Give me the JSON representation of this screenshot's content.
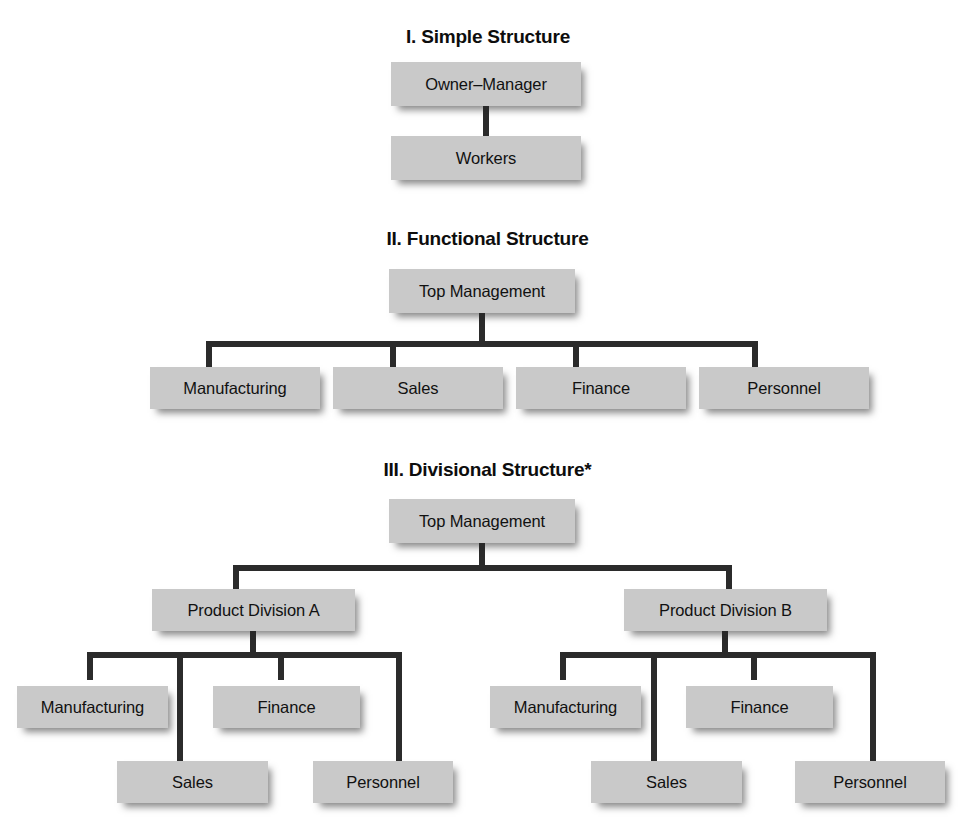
{
  "diagram": {
    "background_color": "#ffffff",
    "box_fill_color": "#c9c9c9",
    "connector_color": "#2b2b2b",
    "text_color": "#111111"
  },
  "sections": [
    {
      "id": "simple",
      "heading": "I. Simple Structure",
      "nodes": [
        {
          "id": "s-owner",
          "label": "Owner–Manager",
          "level": 0
        },
        {
          "id": "s-workers",
          "label": "Workers",
          "level": 1
        }
      ],
      "edges": [
        {
          "from": "s-owner",
          "to": "s-workers"
        }
      ]
    },
    {
      "id": "functional",
      "heading": "II. Functional Structure",
      "nodes": [
        {
          "id": "f-top",
          "label": "Top Management",
          "level": 0
        },
        {
          "id": "f-manufacturing",
          "label": "Manufacturing",
          "level": 1
        },
        {
          "id": "f-sales",
          "label": "Sales",
          "level": 1
        },
        {
          "id": "f-finance",
          "label": "Finance",
          "level": 1
        },
        {
          "id": "f-personnel",
          "label": "Personnel",
          "level": 1
        }
      ],
      "edges": [
        {
          "from": "f-top",
          "to": "f-manufacturing"
        },
        {
          "from": "f-top",
          "to": "f-sales"
        },
        {
          "from": "f-top",
          "to": "f-finance"
        },
        {
          "from": "f-top",
          "to": "f-personnel"
        }
      ]
    },
    {
      "id": "divisional",
      "heading": "III. Divisional Structure*",
      "nodes": [
        {
          "id": "d-top",
          "label": "Top Management",
          "level": 0
        },
        {
          "id": "d-div-a",
          "label": "Product Division A",
          "level": 1
        },
        {
          "id": "d-div-b",
          "label": "Product Division B",
          "level": 1
        },
        {
          "id": "da-manufacturing",
          "label": "Manufacturing",
          "level": 2
        },
        {
          "id": "da-sales",
          "label": "Sales",
          "level": 2
        },
        {
          "id": "da-finance",
          "label": "Finance",
          "level": 2
        },
        {
          "id": "da-personnel",
          "label": "Personnel",
          "level": 2
        },
        {
          "id": "db-manufacturing",
          "label": "Manufacturing",
          "level": 2
        },
        {
          "id": "db-sales",
          "label": "Sales",
          "level": 2
        },
        {
          "id": "db-finance",
          "label": "Finance",
          "level": 2
        },
        {
          "id": "db-personnel",
          "label": "Personnel",
          "level": 2
        }
      ],
      "edges": [
        {
          "from": "d-top",
          "to": "d-div-a"
        },
        {
          "from": "d-top",
          "to": "d-div-b"
        },
        {
          "from": "d-div-a",
          "to": "da-manufacturing"
        },
        {
          "from": "d-div-a",
          "to": "da-sales"
        },
        {
          "from": "d-div-a",
          "to": "da-finance"
        },
        {
          "from": "d-div-a",
          "to": "da-personnel"
        },
        {
          "from": "d-div-b",
          "to": "db-manufacturing"
        },
        {
          "from": "d-div-b",
          "to": "db-sales"
        },
        {
          "from": "d-div-b",
          "to": "db-finance"
        },
        {
          "from": "d-div-b",
          "to": "db-personnel"
        }
      ]
    }
  ],
  "labels": {
    "heading_1": "I. Simple Structure",
    "heading_2": "II. Functional Structure",
    "heading_3": "III. Divisional Structure*",
    "owner_manager": "Owner–Manager",
    "workers": "Workers",
    "top_management_2": "Top Management",
    "f_manufacturing": "Manufacturing",
    "f_sales": "Sales",
    "f_finance": "Finance",
    "f_personnel": "Personnel",
    "top_management_3": "Top Management",
    "product_division_a": "Product Division A",
    "product_division_b": "Product Division B",
    "da_manufacturing": "Manufacturing",
    "da_sales": "Sales",
    "da_finance": "Finance",
    "da_personnel": "Personnel",
    "db_manufacturing": "Manufacturing",
    "db_sales": "Sales",
    "db_finance": "Finance",
    "db_personnel": "Personnel"
  }
}
